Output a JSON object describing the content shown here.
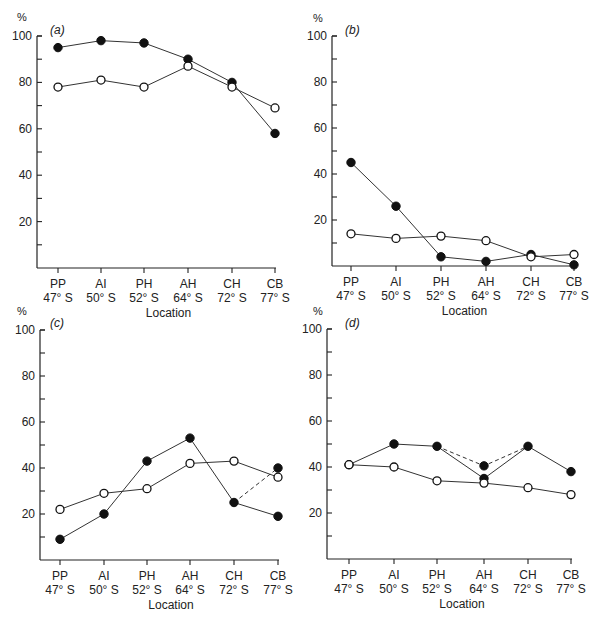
{
  "chart_data": [
    {
      "type": "line",
      "title": "(a)",
      "panel": "a",
      "xlabel": "Location",
      "ylabel": "%",
      "ylim": [
        0,
        100
      ],
      "yticks": [
        20,
        40,
        60,
        80,
        100
      ],
      "categories": [
        "PP 47° S",
        "AI 50° S",
        "PH 52° S",
        "AH 64° S",
        "CH 72° S",
        "CB 77° S"
      ],
      "series": [
        {
          "name": "filled",
          "marker": "filled-circle",
          "values": [
            95,
            98,
            97,
            90,
            80,
            58
          ]
        },
        {
          "name": "open",
          "marker": "open-circle",
          "values": [
            78,
            81,
            78,
            87,
            78,
            69
          ]
        }
      ]
    },
    {
      "type": "line",
      "title": "(b)",
      "panel": "b",
      "xlabel": "Location",
      "ylabel": "%",
      "ylim": [
        0,
        100
      ],
      "yticks": [
        20,
        40,
        60,
        80,
        100
      ],
      "categories": [
        "PP 47° S",
        "AI 50° S",
        "PH 52° S",
        "AH 64° S",
        "CH 72° S",
        "CB 77° S"
      ],
      "series": [
        {
          "name": "filled",
          "marker": "filled-circle",
          "values": [
            45,
            26,
            4,
            2,
            5,
            0.5
          ]
        },
        {
          "name": "open",
          "marker": "open-circle",
          "values": [
            14,
            12,
            13,
            11,
            4,
            5
          ]
        }
      ]
    },
    {
      "type": "line",
      "title": "(c)",
      "panel": "c",
      "xlabel": "Location",
      "ylabel": "%",
      "ylim": [
        0,
        100
      ],
      "yticks": [
        20,
        40,
        60,
        80,
        100
      ],
      "categories": [
        "PP 47° S",
        "AI 50° S",
        "PH 52° S",
        "AH 64° S",
        "CH 72° S",
        "CB 77° S"
      ],
      "series": [
        {
          "name": "filled",
          "marker": "filled-circle",
          "values": [
            9,
            20,
            43,
            53,
            25,
            19
          ]
        },
        {
          "name": "open",
          "marker": "open-circle",
          "values": [
            22,
            29,
            31,
            42,
            43,
            36
          ]
        }
      ],
      "dashed_alternates": [
        {
          "from_index": 4,
          "to_index": 5,
          "from_value": 25,
          "to_value": 40,
          "marker": "filled-circle"
        }
      ]
    },
    {
      "type": "line",
      "title": "(d)",
      "panel": "d",
      "xlabel": "Location",
      "ylabel": "%",
      "ylim": [
        0,
        100
      ],
      "yticks": [
        20,
        40,
        60,
        80,
        100
      ],
      "categories": [
        "PP 47° S",
        "AI 50° S",
        "PH 52° S",
        "AH 64° S",
        "CH 72° S",
        "CB 77° S"
      ],
      "series": [
        {
          "name": "filled",
          "marker": "filled-circle",
          "values": [
            41,
            50,
            49,
            35,
            49,
            38
          ]
        },
        {
          "name": "open",
          "marker": "open-circle",
          "values": [
            41,
            40,
            34,
            33,
            31,
            28
          ]
        }
      ],
      "dashed_alternates": [
        {
          "from_index": 2,
          "via_index": 3,
          "to_index": 4,
          "via_value": 40.5,
          "marker": "filled-circle"
        }
      ]
    }
  ],
  "labels": {
    "unit": "%",
    "location": "Location",
    "sites": [
      {
        "code": "PP",
        "lat": "47° S"
      },
      {
        "code": "AI",
        "lat": "50° S"
      },
      {
        "code": "PH",
        "lat": "52° S"
      },
      {
        "code": "AH",
        "lat": "64° S"
      },
      {
        "code": "CH",
        "lat": "72° S"
      },
      {
        "code": "CB",
        "lat": "77° S"
      }
    ]
  }
}
